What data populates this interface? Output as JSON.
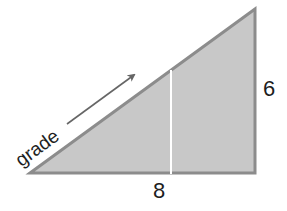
{
  "diagram": {
    "type": "right-triangle",
    "colors": {
      "fill": "#c8c8c8",
      "stroke": "#8c8c8c",
      "divider": "#ffffff",
      "arrow": "#666666",
      "text": "#1e1e1e"
    },
    "labels": {
      "hypotenuse": "grade",
      "base": "8",
      "height": "6"
    },
    "arrow": {
      "direction": "up-right",
      "meaning": "along hypotenuse"
    }
  }
}
